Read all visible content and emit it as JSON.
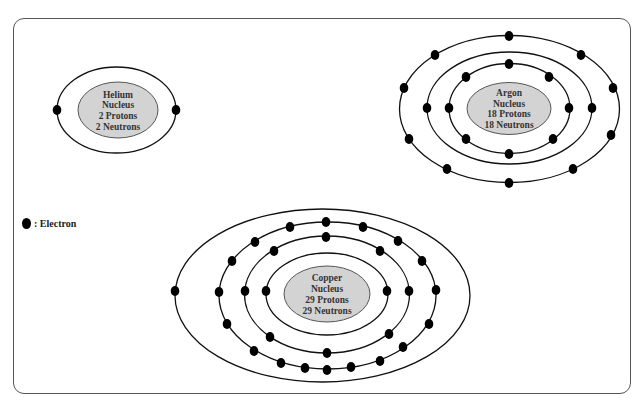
{
  "diagram": {
    "type": "bohr-model-comparison",
    "colors": {
      "frame": "#555555",
      "orbit": "#111111",
      "electron": "#000000",
      "nucleus_fill": "#d3d3d3",
      "nucleus_stroke": "#555555",
      "text": "#333333"
    },
    "legend": {
      "symbol": "electron-dot",
      "label": ": Electron"
    },
    "atoms": [
      {
        "id": "helium",
        "nucleus": {
          "lines": [
            "Helium",
            "Nucleus",
            "2 Protons",
            "2 Neutrons"
          ],
          "cx": 118,
          "cy": 110,
          "rx": 40,
          "ry": 28
        },
        "orbits": [
          {
            "cx": 116.5,
            "cy": 110,
            "rx": 59.5,
            "ry": 43,
            "electrons": [
              [
                57,
                110
              ],
              [
                176,
                110
              ]
            ]
          }
        ]
      },
      {
        "id": "argon",
        "nucleus": {
          "lines": [
            "Argon",
            "Nucleus",
            "18 Protons",
            "18 Neutrons"
          ],
          "cx": 509,
          "cy": 108.5,
          "rx": 42,
          "ry": 26
        },
        "orbits": [
          {
            "cx": 509.5,
            "cy": 108.5,
            "rx": 60.5,
            "ry": 45,
            "electrons": [
              [
                509,
                64
              ],
              [
                466,
                77
              ],
              [
                549,
                77
              ],
              [
                449,
                108
              ],
              [
                569,
                108
              ],
              [
                466,
                139
              ],
              [
                553,
                139
              ],
              [
                509,
                154
              ]
            ]
          },
          {
            "cx": 509.5,
            "cy": 108,
            "rx": 82.5,
            "ry": 56,
            "electrons": [
              [
                427,
                108
              ],
              [
                592,
                108
              ]
            ]
          },
          {
            "cx": 509.5,
            "cy": 109,
            "rx": 110,
            "ry": 73.5,
            "electrons": [
              [
                509,
                36
              ],
              [
                435,
                55
              ],
              [
                581,
                55
              ],
              [
                404,
                88
              ],
              [
                613,
                88
              ],
              [
                409,
                139
              ],
              [
                611,
                135
              ],
              [
                447,
                169
              ],
              [
                573,
                169
              ],
              [
                509,
                183
              ]
            ]
          }
        ]
      },
      {
        "id": "copper",
        "nucleus": {
          "lines": [
            "Copper",
            "Nucleus",
            "29 Protons",
            "29 Neutrons"
          ],
          "cx": 327,
          "cy": 294,
          "rx": 43,
          "ry": 28
        },
        "orbits": [
          {
            "cx": 327,
            "cy": 294,
            "rx": 61,
            "ry": 41,
            "electrons": [
              [
                266,
                291
              ],
              [
                387,
                291
              ]
            ]
          },
          {
            "cx": 327,
            "cy": 294.5,
            "rx": 82.5,
            "ry": 58.5,
            "electrons": [
              [
                326,
                237
              ],
              [
                274,
                251
              ],
              [
                245,
                291
              ],
              [
                270,
                337
              ],
              [
                327,
                353
              ],
              [
                389,
                334
              ],
              [
                409,
                291
              ],
              [
                380,
                251
              ]
            ]
          },
          {
            "cx": 327.5,
            "cy": 295.5,
            "rx": 108.5,
            "ry": 73.5,
            "electrons": [
              [
                326,
                222
              ],
              [
                290,
                227
              ],
              [
                255,
                242
              ],
              [
                232,
                261
              ],
              [
                219,
                292
              ],
              [
                227,
                324
              ],
              [
                254,
                351
              ],
              [
                281,
                363
              ],
              [
                305,
                368
              ],
              [
                327,
                370
              ],
              [
                351,
                367
              ],
              [
                380,
                361
              ],
              [
                403,
                347
              ],
              [
                429,
                324
              ],
              [
                436,
                290
              ],
              [
                422,
                261
              ],
              [
                398,
                241
              ],
              [
                363,
                227
              ]
            ]
          },
          {
            "cx": 322.5,
            "cy": 295.5,
            "rx": 147.5,
            "ry": 86.5,
            "electrons": [
              [
                175,
                291
              ]
            ]
          }
        ]
      }
    ]
  }
}
